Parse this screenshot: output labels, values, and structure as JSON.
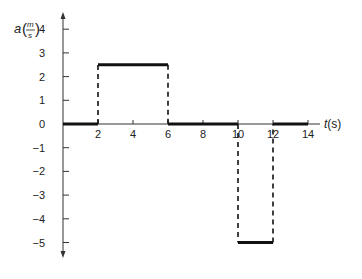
{
  "chart_data": {
    "type": "line",
    "title": "",
    "xlabel": "t(s)",
    "ylabel": "a(m/s)",
    "ylabel_parts": {
      "symbol": "a",
      "num": "m",
      "den": "s"
    },
    "xlim": [
      0,
      14
    ],
    "ylim": [
      -5,
      4
    ],
    "grid": false,
    "legend": null,
    "x_ticks": [
      2,
      4,
      6,
      8,
      10,
      12,
      14
    ],
    "y_ticks": [
      4,
      3,
      2,
      1,
      0,
      -1,
      -2,
      -3,
      -4,
      -5
    ],
    "series": [
      {
        "name": "acceleration",
        "style": "piecewise-constant",
        "segments": [
          {
            "t_start": 0,
            "t_end": 2,
            "a": 0
          },
          {
            "t_start": 2,
            "t_end": 6,
            "a": 2.5
          },
          {
            "t_start": 6,
            "t_end": 10,
            "a": 0
          },
          {
            "t_start": 10,
            "t_end": 12,
            "a": -5
          },
          {
            "t_start": 12,
            "t_end": 14,
            "a": 0
          }
        ],
        "dashed_transitions": [
          {
            "t": 2,
            "from": 0,
            "to": 2.5
          },
          {
            "t": 6,
            "from": 2.5,
            "to": 0
          },
          {
            "t": 10,
            "from": 0,
            "to": -5
          },
          {
            "t": 12,
            "from": -5,
            "to": 0
          }
        ]
      }
    ]
  },
  "colors": {
    "line": "#111111",
    "axis": "#333333",
    "text": "#222222"
  }
}
